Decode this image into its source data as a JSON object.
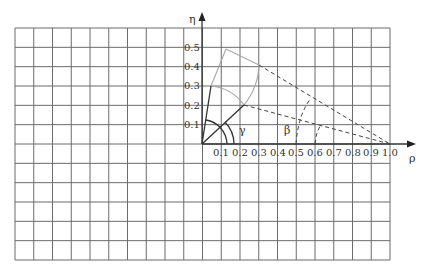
{
  "diagram": {
    "axes": {
      "x_label": "ρ",
      "y_label": "η",
      "x_ticks": [
        "0.1",
        "0.2",
        "0.3",
        "0.4",
        "0.5",
        "0.6",
        "0.7",
        "0.8",
        "0.9",
        "1.0"
      ],
      "y_ticks": [
        "0.1",
        "0.2",
        "0.3",
        "0.4",
        "0.5"
      ]
    },
    "angle_labels": {
      "gamma": "γ",
      "beta": "β"
    },
    "grid": {
      "columns": 20,
      "rows": 12
    },
    "colors": {
      "grid": "#6b6b6b",
      "axis": "#333333",
      "solid_dark": "#333333",
      "light_line": "#a8a8a8",
      "dashed": "#444444"
    }
  }
}
